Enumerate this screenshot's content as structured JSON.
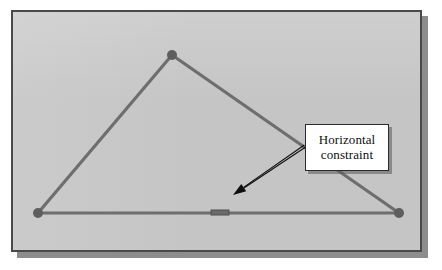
{
  "canvas": {
    "width": 442,
    "height": 270,
    "background_color": "#ffffff"
  },
  "panel": {
    "x": 11,
    "y": 10,
    "width": 411,
    "height": 242,
    "fill_color": "#c5c5c5",
    "border_color": "#4a4a4a",
    "border_width": 2,
    "shadow_color": "#8d8d8d",
    "shadow_offset_x": 6,
    "shadow_offset_y": 6
  },
  "diagram": {
    "title": "Horizontal constraint",
    "line_color": "#6e6e6e",
    "line_width": 3.2,
    "vertex_color": "#5e5e5e",
    "vertex_radius": 5,
    "vertices": [
      {
        "name": "apex",
        "x": 172,
        "y": 55
      },
      {
        "name": "bottom-left",
        "x": 38,
        "y": 213
      },
      {
        "name": "bottom-right",
        "x": 399,
        "y": 213
      }
    ],
    "edges": [
      {
        "name": "left-edge",
        "from": "bottom-left",
        "to": "apex"
      },
      {
        "name": "right-edge",
        "from": "apex",
        "to": "bottom-right"
      },
      {
        "name": "bottom-edge",
        "from": "bottom-left",
        "to": "bottom-right"
      }
    ],
    "constraint_marker": {
      "name": "horizontal-constraint-marker",
      "x": 211,
      "y": 210,
      "width": 18,
      "height": 5,
      "fill_color": "#6a6a6a",
      "stroke_color": "#4f4f4f"
    }
  },
  "callout": {
    "box": {
      "x": 305,
      "y": 124,
      "width": 84,
      "height": 47,
      "fill_color": "#ffffff",
      "border_color": "#2b2b2b"
    },
    "text_lines": [
      "Horizontal",
      "constraint"
    ],
    "text_color": "#101010",
    "leader": {
      "color": "#0f0f0f",
      "width": 1.1,
      "gap": 2.4,
      "from_x": 305,
      "from_y": 146,
      "to_x": 233,
      "to_y": 195,
      "arrowhead_length": 13,
      "arrowhead_half_width": 4.4
    }
  }
}
